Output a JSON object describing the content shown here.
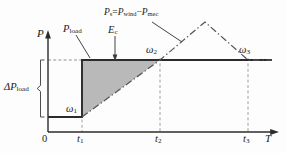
{
  "figure": {
    "type": "diagram",
    "axes": {
      "y_label": "P",
      "x_label": "T",
      "origin_label": "0"
    },
    "x_ticks": [
      {
        "id": "t1",
        "label_main": "t",
        "label_sub": "1"
      },
      {
        "id": "t2",
        "label_main": "t",
        "label_sub": "2"
      },
      {
        "id": "t3",
        "label_main": "t",
        "label_sub": "3"
      }
    ],
    "labels": {
      "delta_p_load": {
        "symbol": "ΔP",
        "sub": "load"
      },
      "p_load": {
        "symbol": "P",
        "sub": "load"
      },
      "energy": {
        "symbol": "E",
        "sub": "c"
      },
      "surplus_main": "Ps=Pwind−Pmec",
      "surplus_parts": {
        "lhs": "P",
        "lhs_sub": "s",
        "eq": "=",
        "term1": "P",
        "term1_sub": "wind",
        "minus": "−",
        "term2": "P",
        "term2_sub": "mec"
      },
      "omega1": {
        "symbol": "ω",
        "sub": "1"
      },
      "omega2": {
        "symbol": "ω",
        "sub": "2"
      },
      "omega3": {
        "symbol": "ω",
        "sub": "3"
      }
    },
    "colors": {
      "line": "#2b2b2b",
      "shade_fill": "#b9b9b9",
      "dash": "#6e6e6e",
      "background": "#fdfdfd"
    }
  }
}
